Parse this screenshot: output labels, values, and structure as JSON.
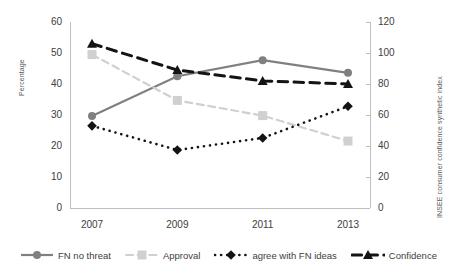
{
  "chart_data": {
    "type": "line",
    "title": "",
    "xlabel": "",
    "categories": [
      "2007",
      "2009",
      "2011",
      "2013"
    ],
    "grid": false,
    "legend_position": "bottom",
    "axes": {
      "left": {
        "label": "Percentage",
        "ylim": [
          0,
          60
        ],
        "ticks": [
          "0",
          "10",
          "20",
          "30",
          "40",
          "50",
          "60"
        ]
      },
      "right": {
        "label": "INSEE consumer confidence synthetic index",
        "ylim": [
          0,
          120
        ],
        "ticks": [
          "0",
          "20",
          "40",
          "60",
          "80",
          "100",
          "120"
        ]
      }
    },
    "series": [
      {
        "name": "FN no threat",
        "axis": "left",
        "color": "#808080",
        "line_style": "solid",
        "marker": "circle",
        "values": [
          29.7,
          42.5,
          47.7,
          43.6
        ]
      },
      {
        "name": "Approval",
        "axis": "left",
        "color": "#d0d0d0",
        "line_style": "dashed",
        "marker": "square",
        "values": [
          49.5,
          34.7,
          29.8,
          21.6
        ]
      },
      {
        "name": "agree with FN ideas",
        "axis": "left",
        "color": "#141414",
        "line_style": "dotted",
        "marker": "diamond",
        "values": [
          26.5,
          18.7,
          22.6,
          32.8
        ]
      },
      {
        "name": "Confidence",
        "axis": "right",
        "color": "#141414",
        "line_style": "dashed",
        "marker": "triangle",
        "values": [
          106,
          89,
          82,
          80
        ]
      }
    ]
  },
  "legend": {
    "items": [
      {
        "label": "FN no threat"
      },
      {
        "label": "Approval"
      },
      {
        "label": "agree with FN ideas"
      },
      {
        "label": "Confidence"
      }
    ]
  }
}
